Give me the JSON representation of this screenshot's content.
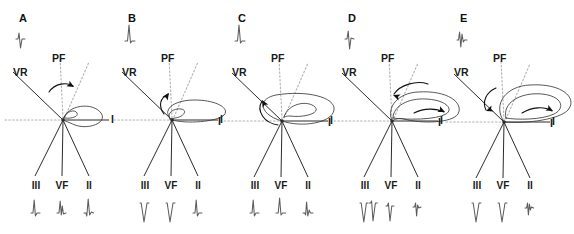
{
  "figure": {
    "type": "frontal-plane-qrs-vector-loop-series",
    "panel_count": 5,
    "colors": {
      "solid_axis": "#2b2b2b",
      "dotted_axis": "#b9b0ac",
      "loop": "#3a3a3a",
      "ecg_trace": "#5d5d5d",
      "label_text": "#1a1a1a",
      "background": "#ffffff"
    },
    "shared_labels": {
      "vr": "VR",
      "pf": "PF",
      "lead_i": "I",
      "lead_iii": "III",
      "lead_vf": "VF",
      "lead_ii": "II"
    },
    "panels": [
      {
        "letter": "A",
        "origin_x": 63,
        "origin_y": 120,
        "vr_label_x": 13,
        "vr_label_y": 66,
        "pf_label_x": 62,
        "pf_label_y": 52,
        "lead_i_label_x": 109,
        "lead_i_label_y": 115,
        "lead_i_label_visible": false,
        "leads_bottom": [
          {
            "name": "III",
            "x": 36,
            "polarity": "positive",
            "morphology": "rS-small-upright"
          },
          {
            "name": "VF",
            "x": 62,
            "polarity": "positive",
            "morphology": "rsR-upright"
          },
          {
            "name": "II",
            "x": 89,
            "polarity": "positive",
            "morphology": "qR-upright"
          }
        ],
        "vr_complex": {
          "polarity": "negative",
          "morphology": "rS"
        },
        "loop": {
          "size": "small",
          "rotation": "clockwise",
          "orientation_deg": -15,
          "description": "small narrow ellipse directed rightward-downward with inner loop"
        },
        "rotation_arrow": {
          "direction": "rightward-clockwise",
          "position": "above-loop"
        }
      },
      {
        "letter": "B",
        "origin_x": 172,
        "origin_y": 120,
        "vr_label_x": 122,
        "vr_label_y": 66,
        "pf_label_x": 171,
        "pf_label_y": 52,
        "lead_i_label_x": 218,
        "lead_i_label_y": 115,
        "lead_i_label_visible": true,
        "leads_bottom": [
          {
            "name": "III",
            "x": 145,
            "polarity": "negative",
            "morphology": "QS-deep"
          },
          {
            "name": "VF",
            "x": 171,
            "polarity": "negative",
            "morphology": "QS-deep"
          },
          {
            "name": "II",
            "x": 198,
            "polarity": "positive",
            "morphology": "rS-small-upright"
          }
        ],
        "vr_complex": {
          "polarity": "positive",
          "morphology": "R-tall"
        },
        "loop": {
          "size": "medium",
          "rotation": "counterclockwise",
          "orientation_deg": -8,
          "description": "elongated flat ellipse extending right with small inner loop"
        },
        "rotation_arrow": {
          "direction": "upward-left",
          "position": "left-of-loop"
        }
      },
      {
        "letter": "C",
        "origin_x": 282,
        "origin_y": 121,
        "vr_label_x": 232,
        "vr_label_y": 66,
        "pf_label_x": 281,
        "pf_label_y": 52,
        "lead_i_label_x": 328,
        "lead_i_label_y": 116,
        "lead_i_label_visible": true,
        "leads_bottom": [
          {
            "name": "III",
            "x": 255,
            "polarity": "positive",
            "morphology": "rS-small-upright"
          },
          {
            "name": "VF",
            "x": 281,
            "polarity": "positive",
            "morphology": "R-upright"
          },
          {
            "name": "II",
            "x": 308,
            "polarity": "positive",
            "morphology": "qRs"
          }
        ],
        "vr_complex": {
          "polarity": "positive",
          "morphology": "R-tall"
        },
        "loop": {
          "size": "large",
          "rotation": "counterclockwise",
          "orientation_deg": -6,
          "description": "wide oval loop crossing origin with prominent inner spiral"
        },
        "rotation_arrow": {
          "direction": "leftward",
          "position": "upper-left-of-loop"
        }
      },
      {
        "letter": "D",
        "origin_x": 392,
        "origin_y": 121,
        "vr_label_x": 342,
        "vr_label_y": 66,
        "pf_label_x": 391,
        "pf_label_y": 52,
        "lead_i_label_x": 438,
        "lead_i_label_y": 116,
        "lead_i_label_visible": true,
        "leads_bottom": [
          {
            "name": "III",
            "x": 365,
            "polarity": "negative",
            "morphology": "QS-deep-pair"
          },
          {
            "name": "VF",
            "x": 391,
            "polarity": "negative",
            "morphology": "rS-deep"
          },
          {
            "name": "II",
            "x": 418,
            "polarity": "negative",
            "morphology": "rS-small-negative"
          }
        ],
        "vr_complex": {
          "polarity": "biphasic",
          "morphology": "rS-biphasic"
        },
        "loop": {
          "size": "large",
          "rotation": "counterclockwise",
          "orientation_deg": -3,
          "description": "broad kidney-shaped loop arching above the I axis toward the right"
        },
        "rotation_arrow": {
          "direction": "leftward-and-rightward",
          "position": "above-loop-and-inside-loop"
        }
      },
      {
        "letter": "E",
        "origin_x": 504,
        "origin_y": 122,
        "vr_label_x": 454,
        "vr_label_y": 66,
        "pf_label_x": 503,
        "pf_label_y": 52,
        "lead_i_label_x": 550,
        "lead_i_label_y": 117,
        "lead_i_label_visible": true,
        "leads_bottom": [
          {
            "name": "III",
            "x": 477,
            "polarity": "negative",
            "morphology": "QS-deep"
          },
          {
            "name": "VF",
            "x": 503,
            "polarity": "negative",
            "morphology": "QS-deep"
          },
          {
            "name": "II",
            "x": 530,
            "polarity": "negative",
            "morphology": "rsr-small-negative"
          }
        ],
        "vr_complex": {
          "polarity": "biphasic",
          "morphology": "rSr-biphasic"
        },
        "loop": {
          "size": "largest",
          "rotation": "counterclockwise",
          "orientation_deg": 0,
          "description": "very wide flat loop arching high above the I axis spanning beyond the panel"
        },
        "rotation_arrow": {
          "direction": "leftward-and-rightward",
          "position": "left-of-loop-and-inside-loop"
        }
      }
    ]
  }
}
